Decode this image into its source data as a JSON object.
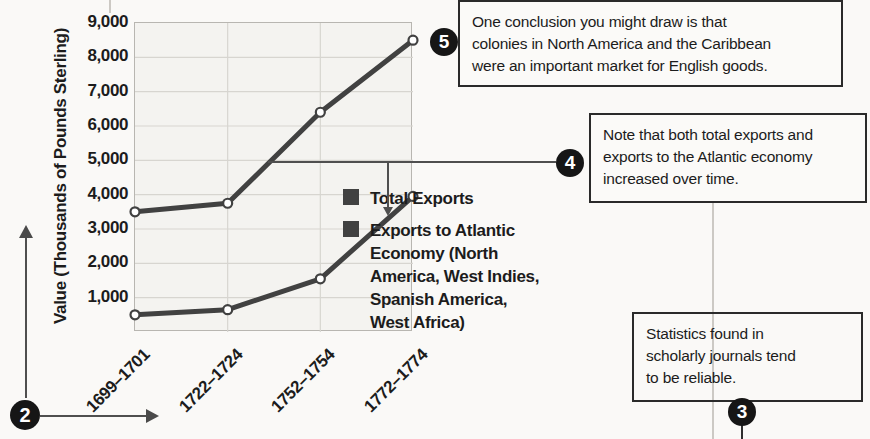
{
  "chart": {
    "y_axis_title": "Value (Thousands of Pounds Sterling)",
    "legend": {
      "items": [
        {
          "label": "Total Exports",
          "color": "#414141"
        },
        {
          "label": "Exports to Atlantic Economy (North America, West Indies, Spanish America, West Africa)",
          "lines": [
            "Exports to Atlantic",
            "Economy (North",
            "America, West Indies,",
            "Spanish America,",
            "West Africa)"
          ],
          "color": "#414141"
        }
      ]
    }
  },
  "chart_data": {
    "type": "line",
    "categories": [
      "1699–1701",
      "1722–1724",
      "1752–1754",
      "1772–1774"
    ],
    "series": [
      {
        "name": "Total Exports",
        "values": [
          3500,
          3750,
          6400,
          8500
        ]
      },
      {
        "name": "Exports to Atlantic Economy (North America, West Indies, Spanish America, West Africa)",
        "values": [
          500,
          650,
          1550,
          3950
        ]
      }
    ],
    "title": "",
    "xlabel": "",
    "ylabel": "Value (Thousands of Pounds Sterling)",
    "ylim": [
      0,
      9000
    ],
    "yticks": [
      1000,
      2000,
      3000,
      4000,
      5000,
      6000,
      7000,
      8000,
      9000
    ],
    "ytick_labels": [
      "1,000",
      "2,000",
      "3,000",
      "4,000",
      "5,000",
      "6,000",
      "7,000",
      "8,000",
      "9,000"
    ],
    "grid": true,
    "legend_position": "right",
    "line_color": "#414141",
    "grid_color": "#d7d5d0",
    "marker": "open-circle"
  },
  "callouts": {
    "c2": {
      "number": "2"
    },
    "c3": {
      "number": "3",
      "lines": [
        "Statistics found in",
        "scholarly journals tend",
        "to be reliable."
      ],
      "text": "Statistics found in scholarly journals tend to be reliable."
    },
    "c4": {
      "number": "4",
      "lines": [
        "Note that both total exports and",
        "exports to the Atlantic economy",
        "increased over time."
      ],
      "text": "Note that both total exports and exports to the Atlantic economy increased over time."
    },
    "c5": {
      "number": "5",
      "lines": [
        "One conclusion you might draw is that",
        "colonies in North America and the Caribbean",
        "were an important market for English goods."
      ],
      "text": "One conclusion you might draw is that colonies in North America and the Caribbean were an important market for English goods."
    }
  }
}
